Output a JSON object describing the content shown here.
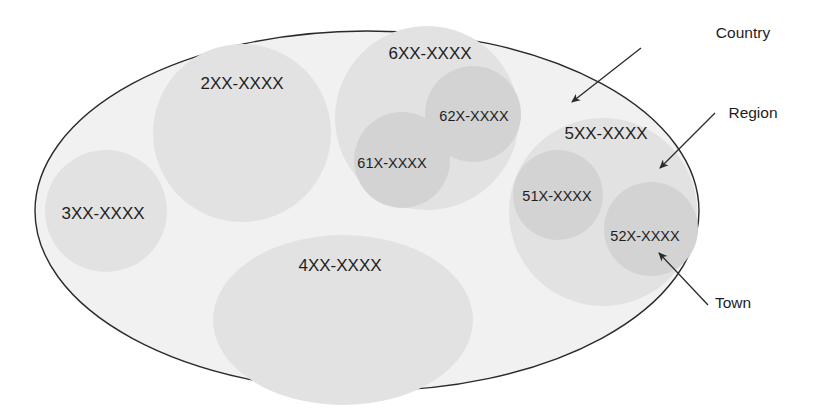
{
  "diagram": {
    "colors": {
      "outer_fill": "#f1f1f1",
      "outer_stroke": "#2a2a2a",
      "region_fill": "#e2e2e2",
      "town_fill": "#d3d3d3",
      "text": "#1e1e1e"
    },
    "country": {
      "cx": 367,
      "cy": 211,
      "rx": 332,
      "ry": 180
    },
    "regions": [
      {
        "id": "2xx",
        "label": "2XX-XXXX",
        "cx": 242,
        "cy": 133,
        "r": 89,
        "label_x": 242,
        "label_y": 84
      },
      {
        "id": "3xx",
        "label": "3XX-XXXX",
        "cx": 106,
        "cy": 211,
        "r": 61,
        "label_x": 103,
        "label_y": 214
      },
      {
        "id": "4xx",
        "label": "4XX-XXXX",
        "cx": 343,
        "cy": 320,
        "rx": 130,
        "ry": 85,
        "label_x": 340,
        "label_y": 266
      },
      {
        "id": "6xx",
        "label": "6XX-XXXX",
        "cx": 427,
        "cy": 118,
        "r": 92,
        "label_x": 430,
        "label_y": 54
      },
      {
        "id": "5xx",
        "label": "5XX-XXXX",
        "cx": 603,
        "cy": 212,
        "r": 94,
        "label_x": 606,
        "label_y": 134
      }
    ],
    "towns": [
      {
        "id": "62x",
        "label": "62X-XXXX",
        "cx": 473,
        "cy": 114,
        "r": 48,
        "label_x": 474,
        "label_y": 116
      },
      {
        "id": "61x",
        "label": "61X-XXXX",
        "cx": 402,
        "cy": 160,
        "r": 48,
        "label_x": 392,
        "label_y": 163
      },
      {
        "id": "51x",
        "label": "51X-XXXX",
        "cx": 558,
        "cy": 195,
        "r": 45,
        "label_x": 557,
        "label_y": 196
      },
      {
        "id": "52x",
        "label": "52X-XXXX",
        "cx": 651,
        "cy": 229,
        "r": 47,
        "label_x": 645,
        "label_y": 236
      }
    ],
    "callouts": [
      {
        "id": "country",
        "label": "Country",
        "label_x": 743,
        "label_y": 33,
        "x1": 641,
        "y1": 48,
        "x2": 572,
        "y2": 102
      },
      {
        "id": "region",
        "label": "Region",
        "label_x": 753,
        "label_y": 113,
        "x1": 715,
        "y1": 113,
        "x2": 660,
        "y2": 168
      },
      {
        "id": "town",
        "label": "Town",
        "label_x": 733,
        "label_y": 303,
        "x1": 708,
        "y1": 305,
        "x2": 659,
        "y2": 253
      }
    ]
  }
}
